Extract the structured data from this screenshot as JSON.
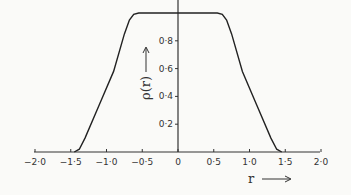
{
  "chart_data": {
    "type": "line",
    "title": "",
    "xlabel": "r",
    "ylabel": "ρ(r)",
    "xlim": [
      -2.0,
      2.0
    ],
    "ylim": [
      0,
      1.0
    ],
    "grid": false,
    "x_ticks": [
      -2.0,
      -1.5,
      -1.0,
      -0.5,
      0,
      0.5,
      1.0,
      1.5,
      2.0
    ],
    "x_tick_labels": [
      "−2·0",
      "−1·5",
      "−1·0",
      "−0·5",
      "0",
      "0·5",
      "1·0",
      "1·5",
      "2·0"
    ],
    "y_ticks": [
      0.2,
      0.4,
      0.6,
      0.8
    ],
    "y_tick_labels": [
      "0·2",
      "0·4",
      "0·6",
      "0·8"
    ],
    "series": [
      {
        "name": "ρ(r)",
        "x": [
          -1.45,
          -1.38,
          -1.3,
          -1.1,
          -0.9,
          -0.75,
          -0.68,
          -0.62,
          -0.55,
          0,
          0.55,
          0.62,
          0.68,
          0.75,
          0.9,
          1.1,
          1.3,
          1.38,
          1.45
        ],
        "y": [
          0,
          0.02,
          0.1,
          0.34,
          0.58,
          0.85,
          0.95,
          0.99,
          1.0,
          1.0,
          1.0,
          0.99,
          0.95,
          0.85,
          0.58,
          0.34,
          0.1,
          0.02,
          0
        ]
      }
    ],
    "x_arrow_label": "r →",
    "y_arrow_label": "ρ(r) →"
  }
}
